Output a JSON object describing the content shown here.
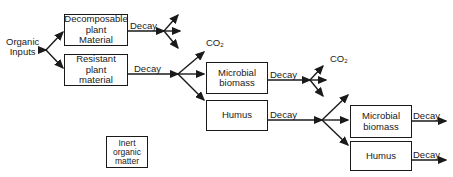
{
  "diagram": {
    "input_label": "Organic\nInputs",
    "boxes": {
      "decomposable": "Decomposable\nplant\nMaterial",
      "resistant": "Resistant\nplant\nmaterial",
      "microbial_1": "Microbial\nbiomass",
      "humus_1": "Humus",
      "microbial_2": "Microbial\nbiomass",
      "humus_2": "Humus",
      "inert": "Inert\norganic\nmatter"
    },
    "decay_label": "Decay",
    "co2_label": "CO",
    "co2_sub": "2"
  }
}
